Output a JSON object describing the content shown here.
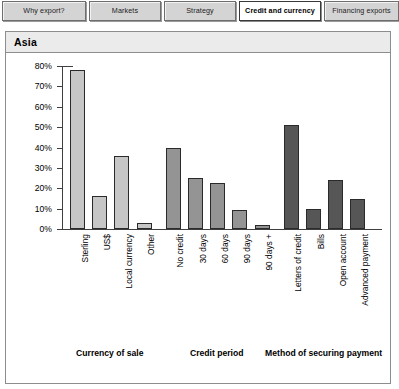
{
  "tabs": [
    {
      "label": "Why export?",
      "active": false
    },
    {
      "label": "Markets",
      "active": false
    },
    {
      "label": "Strategy",
      "active": false
    },
    {
      "label": "Credit and currency",
      "active": true
    },
    {
      "label": "Financing exports",
      "active": false
    }
  ],
  "card": {
    "header_title": "Asia"
  },
  "colors": {
    "group1_fill": "#c6c6c6",
    "group2_fill": "#949494",
    "group3_fill": "#565656",
    "bar_stroke": "#2a2a2a",
    "axis": "#3f3f3f",
    "header_band": "#ebebeb",
    "tab_face": "#d4d4d4",
    "tab_active_face": "#ffffff"
  },
  "chart_data": {
    "type": "bar",
    "title": "Asia",
    "xlabel": "",
    "ylabel": "",
    "ylim": [
      0,
      80
    ],
    "ytick_labels": [
      "0%",
      "10%",
      "20%",
      "30%",
      "40%",
      "50%",
      "60%",
      "70%",
      "80%"
    ],
    "ytick_values": [
      0,
      10,
      20,
      30,
      40,
      50,
      60,
      70,
      80
    ],
    "grid": false,
    "legend": "none",
    "value_unit": "%",
    "categories": [
      "Sterling",
      "US$",
      "Local currency",
      "Other",
      "No credit",
      "30 days",
      "60 days",
      "90 days",
      "90 days +",
      "Letters of credit",
      "Bills",
      "Open account",
      "Advanced payment"
    ],
    "values": [
      78,
      16,
      36,
      3,
      40,
      25,
      22.5,
      9.5,
      2,
      51,
      10,
      24,
      14.5
    ],
    "groups": [
      {
        "label": "Currency of sale",
        "categories": [
          "Sterling",
          "US$",
          "Local currency",
          "Other"
        ],
        "values": [
          78,
          16,
          36,
          3
        ]
      },
      {
        "label": "Credit period",
        "categories": [
          "No credit",
          "30 days",
          "60 days",
          "90 days",
          "90 days +"
        ],
        "values": [
          40,
          25,
          22.5,
          9.5,
          2
        ]
      },
      {
        "label": "Method of securing payment",
        "categories": [
          "Letters of credit",
          "Bills",
          "Open account",
          "Advanced payment"
        ],
        "values": [
          51,
          10,
          24,
          14.5
        ]
      }
    ]
  }
}
